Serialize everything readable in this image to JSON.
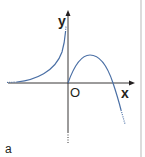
{
  "figure": {
    "panel_label": "a",
    "axes": {
      "x_label": "x",
      "y_label": "y",
      "origin_label": "O"
    },
    "curves": [
      {
        "name": "left-branch",
        "description": "increasing curve approaching x-axis asymptotically on left, rising steeply toward y-axis"
      },
      {
        "name": "right-branch",
        "description": "curve from origin rising to a maximum then falling through x-axis and downward"
      }
    ],
    "colors": {
      "curve": "#4a6fa5",
      "axis": "#231f20",
      "divider": "#dcdcdc"
    }
  }
}
